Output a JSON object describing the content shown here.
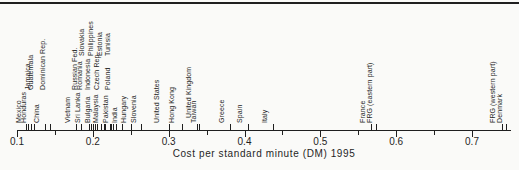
{
  "colors": {
    "ink": "#1f1f1f",
    "background": "#fafaf8"
  },
  "chart_data": {
    "type": "scatter",
    "variant": "one-dimensional strip plot with rotated point labels above a horizontal axis",
    "title": "",
    "xlabel": "Cost per standard minute (DM) 1995",
    "ylabel": "",
    "xlim": [
      0.1,
      0.75
    ],
    "grid": false,
    "x_major_ticks": [
      0.1,
      0.2,
      0.3,
      0.4,
      0.5,
      0.6,
      0.7
    ],
    "x_tick_labels": [
      "0.1",
      "0.2",
      "0.3",
      "0.4",
      "0.5",
      "0.6",
      "0.7"
    ],
    "x_minor_ticks": [
      0.15,
      0.25,
      0.35,
      0.45,
      0.55,
      0.65
    ],
    "points": [
      {
        "label": "Mexico",
        "value": 0.112,
        "level": 0,
        "dx": 1
      },
      {
        "label": "Honduras",
        "value": 0.115,
        "level": 0,
        "dx": 3.5
      },
      {
        "label": "Jamaica",
        "value": 0.118,
        "level": 2,
        "dx": 5.5
      },
      {
        "label": "Guatemala",
        "value": 0.123,
        "level": 2,
        "dx": 5
      },
      {
        "label": "China",
        "value": 0.137,
        "level": 0,
        "dx": 0
      },
      {
        "label": "Dominican Rep.",
        "value": 0.143,
        "level": 2,
        "dx": 1
      },
      {
        "label": "Vietnam",
        "value": 0.178,
        "level": 0,
        "dx": 0
      },
      {
        "label": "Russian Fed.",
        "value": 0.184,
        "level": 2,
        "dx": 2.5
      },
      {
        "label": "Sri Lanka",
        "value": 0.195,
        "level": 0,
        "dx": -3
      },
      {
        "label": "Bulgaria",
        "value": 0.197,
        "level": 0,
        "dx": 5
      },
      {
        "label": "Romania",
        "value": 0.2,
        "level": 2,
        "dx": -5
      },
      {
        "label": "Indonesia",
        "value": 0.203,
        "level": 2,
        "dx": 1
      },
      {
        "label": "Malaysia",
        "value": 0.206,
        "level": 0,
        "dx": 7
      },
      {
        "label": "Slovakia",
        "value": 0.211,
        "level": 3,
        "dx": -11
      },
      {
        "label": "Philippines",
        "value": 0.214,
        "level": 3,
        "dx": -4.5
      },
      {
        "label": "Czech Rep.",
        "value": 0.216,
        "level": 2,
        "dx": 0
      },
      {
        "label": "Estonia",
        "value": 0.222,
        "level": 3,
        "dx": -1.5
      },
      {
        "label": "Tunisia",
        "value": 0.224,
        "level": 3,
        "dx": 5
      },
      {
        "label": "Pakistan",
        "value": 0.227,
        "level": 0,
        "dx": 1
      },
      {
        "label": "Poland",
        "value": 0.23,
        "level": 2,
        "dx": 0
      },
      {
        "label": "India",
        "value": 0.238,
        "level": 0,
        "dx": 1
      },
      {
        "label": "Hungary",
        "value": 0.25,
        "level": 0,
        "dx": 1
      },
      {
        "label": "Slovenia",
        "value": 0.264,
        "level": 0,
        "dx": 1
      },
      {
        "label": "United States",
        "value": 0.3,
        "level": 0,
        "dx": -4
      },
      {
        "label": "Hong Kong",
        "value": 0.317,
        "level": 0,
        "dx": -1.5
      },
      {
        "label": "United Kingdom",
        "value": 0.337,
        "level": 1,
        "dx": 0
      },
      {
        "label": "Taiwan",
        "value": 0.34,
        "level": 0,
        "dx": 3
      },
      {
        "label": "Greece",
        "value": 0.381,
        "level": 0,
        "dx": 0
      },
      {
        "label": "Spain",
        "value": 0.404,
        "level": 0,
        "dx": 0
      },
      {
        "label": "Italy",
        "value": 0.437,
        "level": 0,
        "dx": 0
      },
      {
        "label": "France",
        "value": 0.567,
        "level": 0,
        "dx": 0
      },
      {
        "label": "FRG (eastern part)",
        "value": 0.573,
        "level": 0,
        "dx": 2
      },
      {
        "label": "FRG (western part)",
        "value": 0.74,
        "level": 0,
        "dx": -1
      },
      {
        "label": "Denmark",
        "value": 0.745,
        "level": 0,
        "dx": 1.5
      }
    ]
  }
}
